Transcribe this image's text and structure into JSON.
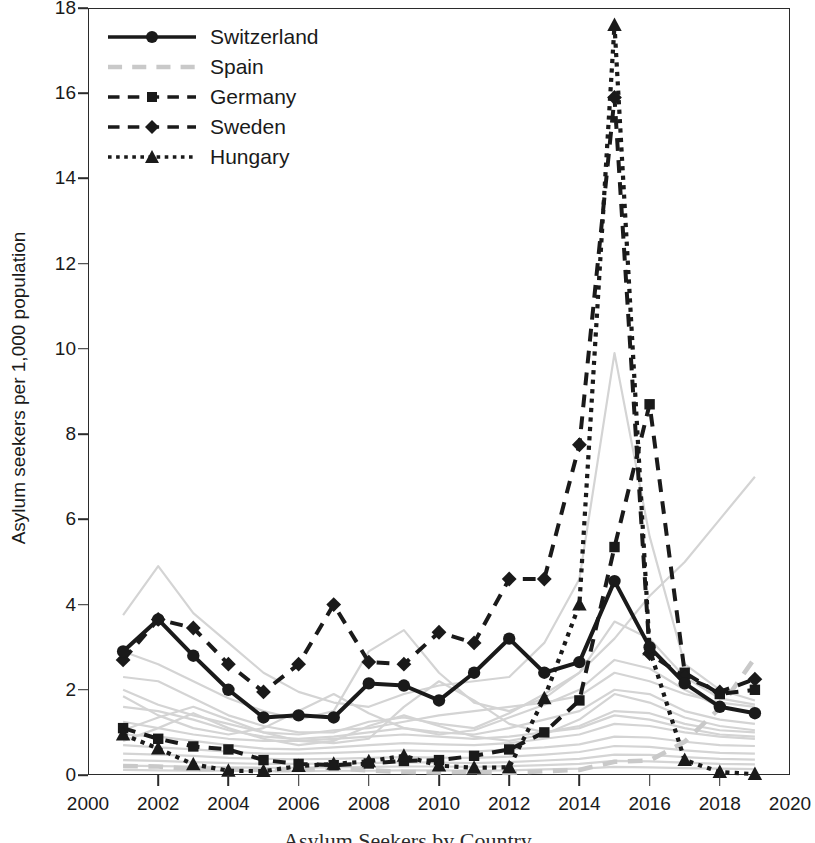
{
  "chart_data": {
    "type": "line",
    "title": "",
    "xlabel": "",
    "ylabel": "Asylum seekers per 1,000 population",
    "xlim": [
      2000,
      2020
    ],
    "ylim": [
      0,
      18
    ],
    "xticks": [
      2000,
      2002,
      2004,
      2006,
      2008,
      2010,
      2012,
      2014,
      2016,
      2018,
      2020
    ],
    "yticks": [
      0,
      2,
      4,
      6,
      8,
      10,
      12,
      14,
      16,
      18
    ],
    "grid": false,
    "legend_position": "top-left",
    "x": [
      2001,
      2002,
      2003,
      2004,
      2005,
      2006,
      2007,
      2008,
      2009,
      2010,
      2011,
      2012,
      2013,
      2014,
      2015,
      2016,
      2017,
      2018,
      2019
    ],
    "series": [
      {
        "name": "Switzerland",
        "style": "solid",
        "marker": "circle",
        "color": "#1a1a1a",
        "values": [
          2.9,
          3.65,
          2.8,
          2.0,
          1.35,
          1.4,
          1.35,
          2.15,
          2.1,
          1.75,
          2.4,
          3.2,
          2.4,
          2.65,
          4.55,
          3.0,
          2.15,
          1.6,
          1.45
        ]
      },
      {
        "name": "Spain",
        "style": "dashed",
        "marker": "none",
        "color": "#c9c9c9",
        "values": [
          0.21,
          0.2,
          0.14,
          0.13,
          0.12,
          0.12,
          0.16,
          0.11,
          0.07,
          0.06,
          0.07,
          0.05,
          0.09,
          0.12,
          0.31,
          0.34,
          0.78,
          1.57,
          2.75
        ]
      },
      {
        "name": "Germany",
        "style": "dashed",
        "marker": "square",
        "color": "#1a1a1a",
        "values": [
          1.1,
          0.85,
          0.67,
          0.6,
          0.35,
          0.26,
          0.23,
          0.27,
          0.33,
          0.35,
          0.45,
          0.6,
          1.0,
          1.75,
          5.35,
          8.7,
          2.4,
          1.9,
          2.0
        ]
      },
      {
        "name": "Sweden",
        "style": "dashed",
        "marker": "diamond",
        "color": "#1a1a1a",
        "values": [
          2.7,
          3.65,
          3.45,
          2.6,
          1.95,
          2.6,
          4.0,
          2.65,
          2.6,
          3.35,
          3.1,
          4.6,
          4.6,
          7.75,
          15.9,
          2.85,
          2.3,
          1.95,
          2.25
        ]
      },
      {
        "name": "Hungary",
        "style": "dotted",
        "marker": "triangle",
        "color": "#1a1a1a",
        "values": [
          0.95,
          0.62,
          0.25,
          0.1,
          0.09,
          0.21,
          0.26,
          0.32,
          0.45,
          0.22,
          0.17,
          0.18,
          1.8,
          4.0,
          17.6,
          2.95,
          0.35,
          0.07,
          0.02
        ]
      }
    ],
    "background_series": [
      {
        "name": "bg-01",
        "values": [
          3.75,
          4.9,
          3.8,
          3.1,
          2.4,
          1.95,
          1.7,
          1.6,
          1.9,
          2.1,
          2.2,
          2.3,
          3.1,
          4.6,
          9.9,
          5.6,
          2.6,
          2.0,
          1.75
        ]
      },
      {
        "name": "bg-02",
        "values": [
          2.9,
          2.6,
          2.2,
          1.8,
          1.5,
          1.3,
          1.5,
          2.9,
          3.4,
          2.4,
          1.7,
          1.5,
          1.8,
          2.4,
          3.2,
          4.2,
          5.0,
          6.0,
          7.0
        ]
      },
      {
        "name": "bg-03",
        "values": [
          2.3,
          2.2,
          1.8,
          1.4,
          1.15,
          1.0,
          1.0,
          1.25,
          1.35,
          1.2,
          1.1,
          1.45,
          1.9,
          2.4,
          3.6,
          3.2,
          2.3,
          1.8,
          1.65
        ]
      },
      {
        "name": "bg-04",
        "values": [
          2.0,
          1.65,
          1.4,
          1.2,
          1.0,
          0.95,
          1.05,
          1.1,
          1.25,
          1.4,
          1.5,
          1.6,
          1.7,
          1.85,
          2.4,
          2.2,
          1.9,
          1.7,
          1.6
        ]
      },
      {
        "name": "bg-05",
        "values": [
          1.6,
          1.5,
          1.3,
          1.05,
          0.9,
          0.85,
          0.9,
          1.0,
          1.1,
          1.0,
          0.95,
          1.1,
          1.3,
          1.5,
          2.0,
          1.9,
          1.5,
          1.3,
          1.2
        ]
      },
      {
        "name": "bg-06",
        "values": [
          1.25,
          1.1,
          0.95,
          0.85,
          0.8,
          0.8,
          0.85,
          0.9,
          0.95,
          0.9,
          0.85,
          0.9,
          1.0,
          1.15,
          1.5,
          1.45,
          1.2,
          1.05,
          1.0
        ]
      },
      {
        "name": "bg-07",
        "values": [
          0.95,
          0.9,
          0.8,
          0.7,
          0.62,
          0.6,
          0.65,
          0.7,
          0.75,
          0.72,
          0.7,
          0.75,
          0.85,
          0.95,
          1.2,
          1.15,
          1.0,
          0.9,
          0.85
        ]
      },
      {
        "name": "bg-08",
        "values": [
          0.7,
          0.65,
          0.6,
          0.55,
          0.5,
          0.5,
          0.52,
          0.55,
          0.58,
          0.56,
          0.55,
          0.6,
          0.65,
          0.72,
          0.9,
          0.88,
          0.78,
          0.7,
          0.68
        ]
      },
      {
        "name": "bg-09",
        "values": [
          0.5,
          0.48,
          0.45,
          0.4,
          0.38,
          0.37,
          0.38,
          0.4,
          0.42,
          0.41,
          0.4,
          0.43,
          0.48,
          0.54,
          0.68,
          0.66,
          0.58,
          0.52,
          0.5
        ]
      },
      {
        "name": "bg-10",
        "values": [
          0.35,
          0.33,
          0.3,
          0.28,
          0.26,
          0.26,
          0.27,
          0.28,
          0.3,
          0.29,
          0.28,
          0.3,
          0.34,
          0.38,
          0.48,
          0.47,
          0.42,
          0.38,
          0.36
        ]
      },
      {
        "name": "bg-11",
        "values": [
          0.22,
          0.21,
          0.2,
          0.18,
          0.17,
          0.17,
          0.18,
          0.19,
          0.2,
          0.2,
          0.19,
          0.21,
          0.23,
          0.26,
          0.33,
          0.32,
          0.29,
          0.26,
          0.25
        ]
      },
      {
        "name": "bg-12",
        "values": [
          0.12,
          0.11,
          0.1,
          0.1,
          0.09,
          0.09,
          0.1,
          0.1,
          0.11,
          0.11,
          0.1,
          0.11,
          0.13,
          0.15,
          0.19,
          0.18,
          0.16,
          0.15,
          0.14
        ]
      },
      {
        "name": "bg-13",
        "values": [
          1.05,
          1.35,
          1.6,
          1.3,
          1.0,
          0.8,
          0.75,
          0.85,
          1.6,
          2.2,
          1.75,
          1.2,
          1.0,
          1.1,
          1.4,
          1.3,
          1.1,
          0.95,
          0.9
        ]
      },
      {
        "name": "bg-14",
        "values": [
          1.85,
          1.4,
          1.1,
          0.95,
          1.1,
          1.5,
          1.9,
          1.45,
          1.1,
          0.95,
          1.05,
          1.35,
          1.65,
          2.0,
          2.7,
          2.5,
          2.0,
          1.6,
          1.45
        ]
      },
      {
        "name": "bg-15",
        "values": [
          0.8,
          1.1,
          1.45,
          1.1,
          0.85,
          0.7,
          0.8,
          1.15,
          1.4,
          1.15,
          0.9,
          0.8,
          0.95,
          1.3,
          1.9,
          1.7,
          1.35,
          1.15,
          1.05
        ]
      }
    ]
  },
  "legend": {
    "items": [
      {
        "label": "Switzerland"
      },
      {
        "label": "Spain"
      },
      {
        "label": "Germany"
      },
      {
        "label": "Sweden"
      },
      {
        "label": "Hungary"
      }
    ]
  },
  "caption": "Asylum Seekers by Country"
}
